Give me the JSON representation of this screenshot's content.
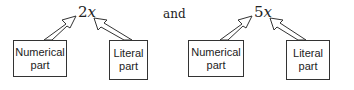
{
  "diagrams": [
    {
      "coefficient": "2",
      "variable": "x",
      "left_label_line1": "Numerical",
      "left_label_line2": "part",
      "right_label_line1": "Literal",
      "right_label_line2": "part"
    },
    {
      "coefficient": "5",
      "variable": "x",
      "left_label_line1": "Numerical",
      "left_label_line2": "part",
      "right_label_line1": "Literal",
      "right_label_line2": "part"
    }
  ],
  "connector": "and"
}
